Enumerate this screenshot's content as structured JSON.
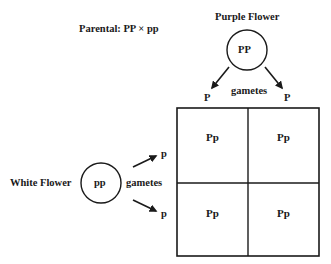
{
  "title": "Parental: PP × pp",
  "parent1": {
    "label": "Purple Flower",
    "genotype": "PP",
    "gametes_label": "gametes",
    "gametes": [
      "P",
      "P"
    ]
  },
  "parent2": {
    "label": "White Flower",
    "genotype": "pp",
    "gametes_label": "gametes",
    "gametes": [
      "p",
      "p"
    ]
  },
  "punnett_square": {
    "rows": [
      [
        "Pp",
        "Pp"
      ],
      [
        "Pp",
        "Pp"
      ]
    ]
  },
  "colors": {
    "stroke": "#1a1a1a",
    "background": "#ffffff"
  }
}
